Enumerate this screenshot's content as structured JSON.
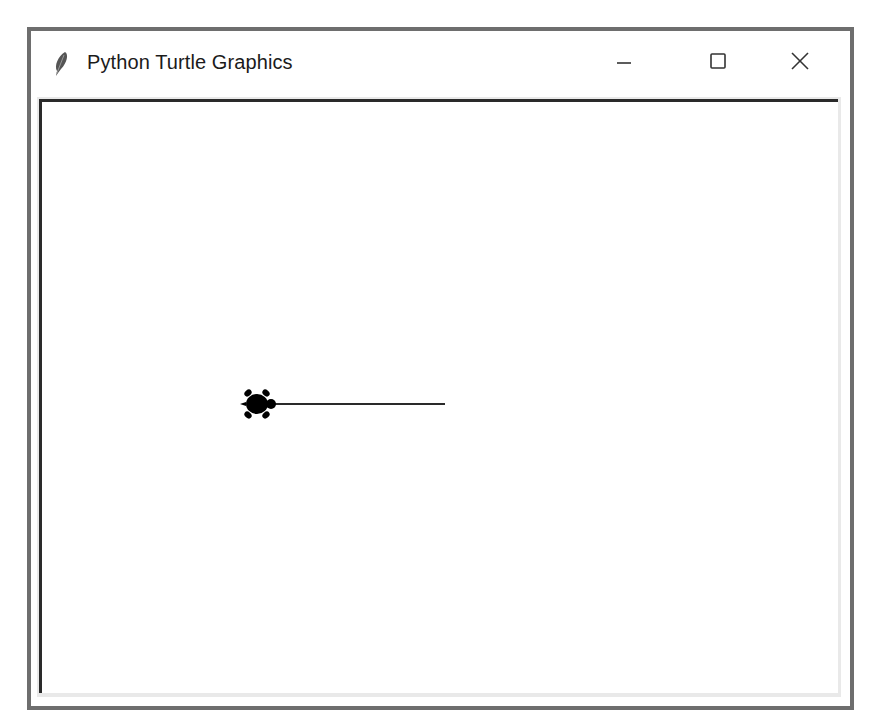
{
  "window": {
    "title": "Python Turtle Graphics",
    "app_icon": "feather-icon",
    "controls": {
      "minimize": "minimize-icon",
      "maximize": "maximize-icon",
      "close": "close-icon"
    }
  },
  "canvas": {
    "background": "#ffffff",
    "line": {
      "color": "#2a2a2a",
      "x1": 272,
      "y1": 401,
      "x2": 442,
      "y2": 401
    },
    "turtle": {
      "shape": "turtle",
      "color": "#000000",
      "x": 254,
      "y": 401,
      "heading": "east"
    }
  }
}
